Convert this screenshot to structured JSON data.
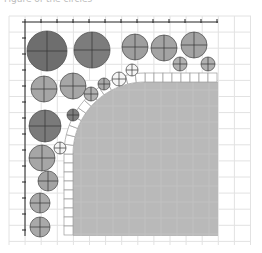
{
  "caption": "Figure of the circles",
  "grid": {
    "x0": 9,
    "y0": 16,
    "x1": 251,
    "y1": 245,
    "step": 16.1,
    "color": "#e2e2e2"
  },
  "axes": {
    "origin": [
      25,
      22
    ],
    "x_end": 218,
    "y_end": 236,
    "tick_step": 16,
    "color": "#222222"
  },
  "region": {
    "x": 73,
    "y": 82,
    "x_end": 218,
    "y_end": 236,
    "corner_radius": 72,
    "fill": "#b9b9b9",
    "tile_band": 9,
    "tile_fill": "#ffffff",
    "tile_stroke": "#9a9a9a"
  },
  "circles": [
    {
      "cx": 47,
      "cy": 51,
      "r": 20,
      "fill": "#6e6e6e"
    },
    {
      "cx": 92,
      "cy": 50,
      "r": 18,
      "fill": "#7c7c7c"
    },
    {
      "cx": 135,
      "cy": 47,
      "r": 13,
      "fill": "#9e9e9e"
    },
    {
      "cx": 164,
      "cy": 48,
      "r": 13,
      "fill": "#a3a3a3"
    },
    {
      "cx": 194,
      "cy": 45,
      "r": 13,
      "fill": "#a3a3a3"
    },
    {
      "cx": 180,
      "cy": 64,
      "r": 7,
      "fill": "#b0b0b0"
    },
    {
      "cx": 208,
      "cy": 64,
      "r": 7,
      "fill": "#b0b0b0"
    },
    {
      "cx": 44,
      "cy": 89,
      "r": 13,
      "fill": "#a6a6a6"
    },
    {
      "cx": 73,
      "cy": 86,
      "r": 13,
      "fill": "#a6a6a6"
    },
    {
      "cx": 91,
      "cy": 94,
      "r": 7,
      "fill": "#b0b0b0"
    },
    {
      "cx": 104,
      "cy": 84,
      "r": 6,
      "fill": "#a9a9a9"
    },
    {
      "cx": 119,
      "cy": 79,
      "r": 7,
      "fill": "#f4f4f4"
    },
    {
      "cx": 132,
      "cy": 70,
      "r": 6,
      "fill": "#f4f4f4"
    },
    {
      "cx": 45,
      "cy": 126,
      "r": 16,
      "fill": "#7a7a7a"
    },
    {
      "cx": 73,
      "cy": 115,
      "r": 6,
      "fill": "#7e7e7e"
    },
    {
      "cx": 42,
      "cy": 158,
      "r": 13,
      "fill": "#a6a6a6"
    },
    {
      "cx": 60,
      "cy": 148,
      "r": 6,
      "fill": "#f2f2f2"
    },
    {
      "cx": 48,
      "cy": 181,
      "r": 10,
      "fill": "#a3a3a3"
    },
    {
      "cx": 40,
      "cy": 203,
      "r": 10,
      "fill": "#a9a9a9"
    },
    {
      "cx": 40,
      "cy": 227,
      "r": 10,
      "fill": "#a9a9a9"
    }
  ]
}
